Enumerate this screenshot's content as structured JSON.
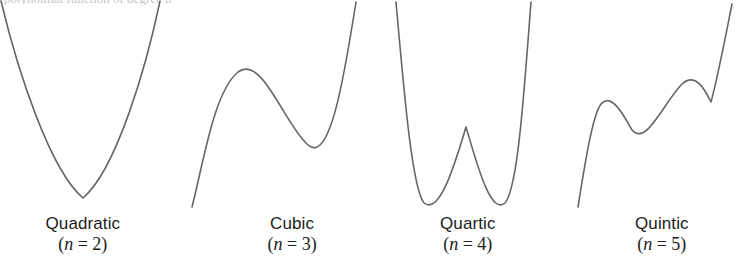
{
  "figure": {
    "background_color": "#ffffff",
    "stroke_color": "#666666",
    "text_color": "#1c1c1c",
    "width": 741,
    "height": 268,
    "cropped_top_text": "polynomial function of degree n"
  },
  "chart_data": {
    "type": "line",
    "title": "",
    "subtitle": "",
    "xlabel": "",
    "ylabel": "",
    "grid": false,
    "legend_position": "below-each-panel",
    "axis_visible": false,
    "tick_labels": [],
    "panels": [
      {
        "name": "Quadratic",
        "degree": 2,
        "degree_text": "(n = 2)",
        "label_center_x": 83,
        "shape": "single U-shaped parabola opening upward",
        "turning_points": 1,
        "local_maxima": [],
        "local_minima": [
          [
            83,
            198
          ]
        ],
        "path": "M 1,1 C 18,72 50,170 83,198 C 116,170 146,68 160,1"
      },
      {
        "name": "Cubic",
        "degree": 3,
        "degree_text": "(n = 3)",
        "label_center_x": 292,
        "shape": "rising S-curve with one hump and one dip",
        "turning_points": 2,
        "local_maxima": [
          [
            238,
            72
          ]
        ],
        "local_minima": [
          [
            308,
            145
          ]
        ],
        "path": "M 192,207 C 204,160 214,92 238,72 C 262,54 284,124 308,145 C 330,164 344,78 356,2"
      },
      {
        "name": "Quartic",
        "degree": 4,
        "degree_text": "(n = 4)",
        "label_center_x": 468,
        "shape": "W-shaped curve with two wells and a central hump",
        "turning_points": 3,
        "local_maxima": [
          [
            466,
            127
          ]
        ],
        "local_minima": [
          [
            424,
            203
          ],
          [
            505,
            203
          ]
        ],
        "path": "M 396,2 C 404,92 412,188 424,203 C 440,216 456,160 466,127 C 476,160 490,216 505,203 C 518,188 524,92 531,2"
      },
      {
        "name": "Quintic",
        "degree": 5,
        "degree_text": "(n = 5)",
        "label_center_x": 662,
        "shape": "rising curve with two humps and two dips",
        "turning_points": 4,
        "local_maxima": [
          [
            601,
            104
          ],
          [
            681,
            85
          ]
        ],
        "local_minima": [
          [
            632,
            130
          ],
          [
            711,
            102
          ]
        ],
        "path": "M 578,207 C 584,170 592,116 601,104 C 612,92 624,116 632,130 C 646,146 662,106 681,85 C 696,70 706,92 711,102 C 718,76 726,34 732,4"
      }
    ]
  }
}
